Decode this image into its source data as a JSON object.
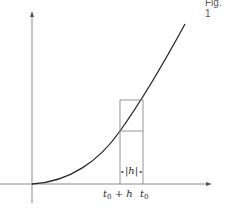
{
  "figure": {
    "caption": "Fig. 1",
    "colors": {
      "axis": "#8a8a8a",
      "curve": "#2a2a2a",
      "box": "#7a7a7a",
      "background": "#ffffff"
    }
  },
  "axes": {
    "x_axis": {
      "has_arrow": true
    },
    "y_axis": {
      "has_arrow": true
    }
  },
  "curve": {
    "shape": "convex increasing (parabola-like) from origin"
  },
  "annotations": {
    "left_tick": {
      "var": "t",
      "sub": "0",
      "suffix": " + h"
    },
    "right_tick": {
      "var": "t",
      "sub": "0",
      "suffix": ""
    },
    "width_marker": "|h|"
  }
}
